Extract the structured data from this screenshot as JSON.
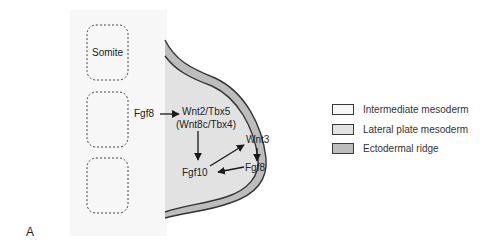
{
  "figure": {
    "panel_letter": "A",
    "regions": {
      "intermediate_mesoderm_color": "#f7f7f7",
      "lateral_plate_mesoderm_color": "#e2e2e2",
      "ectodermal_ridge_color": "#bdbdbd",
      "outline_color": "#333333"
    },
    "somites": [
      {
        "label": "Somite"
      },
      {
        "label": ""
      },
      {
        "label": ""
      }
    ],
    "labels": {
      "fgf8_left": "Fgf8",
      "wnt2_tbx5": "Wnt2/Tbx5",
      "wnt8c_tbx4": "(Wnt8c/Tbx4)",
      "wnt3": "Wnt3",
      "fgf8_right": "Fgf8",
      "fgf10": "Fgf10"
    },
    "arrows": [
      {
        "from": "Fgf8",
        "to": "Wnt2/Tbx5"
      },
      {
        "from": "Wnt2/Tbx5",
        "to": "Fgf10"
      },
      {
        "from": "Fgf10",
        "to": "Wnt3"
      },
      {
        "from": "Wnt3",
        "to": "Fgf8"
      },
      {
        "from": "Fgf8",
        "to": "Fgf10"
      }
    ]
  },
  "legend": {
    "items": [
      {
        "label": "Intermediate mesoderm",
        "color": "#f7f7f7"
      },
      {
        "label": "Lateral plate mesoderm",
        "color": "#e2e2e2"
      },
      {
        "label": "Ectodermal ridge",
        "color": "#bdbdbd"
      }
    ]
  }
}
